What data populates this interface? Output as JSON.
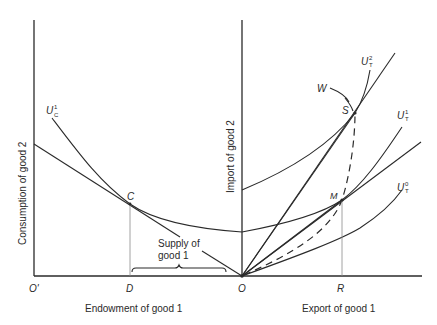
{
  "diagram": {
    "left_panel": {
      "y_axis_label": "Consumption of good 2",
      "x_axis_label": "Endowment of good 1",
      "origin_label": "O'",
      "tick_D": "D",
      "point_C": "C",
      "curve_label": {
        "base": "U",
        "sub": "C",
        "sup": "1"
      },
      "annotation": {
        "line1": "Supply of",
        "line2": "good 1"
      }
    },
    "right_panel": {
      "y_axis_label": "Import of good 2",
      "x_axis_label": "Export of good 1",
      "origin_label": "O",
      "tick_R": "R",
      "point_M": "M",
      "point_S": "S",
      "offer_curve_label": "W",
      "curve_labels": [
        {
          "base": "U",
          "sub": "T",
          "sup": "2"
        },
        {
          "base": "U",
          "sub": "T",
          "sup": "1"
        },
        {
          "base": "U",
          "sub": "T",
          "sup": "0"
        }
      ]
    },
    "colors": {
      "ink": "#2a2a2a",
      "guide": "#8a8a8a",
      "background": "#ffffff"
    }
  }
}
